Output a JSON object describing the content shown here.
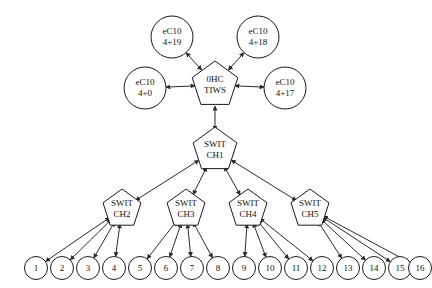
{
  "diagram": {
    "background_color": "#ffffff",
    "stroke_color": "#1a1a1a",
    "edge_color": "#2b2b2b",
    "text_color": "#111111",
    "edge_style": "bidirectional-arrow"
  },
  "root_switch": {
    "name": "switch-0",
    "shape": "pentagon",
    "line1": "0HC",
    "line2": "TIWS",
    "x": 215,
    "y": 85
  },
  "endpoints": [
    {
      "name": "endpoint-4-19",
      "line1": "eC10",
      "line2": "4+19",
      "x": 172,
      "y": 37
    },
    {
      "name": "endpoint-4-18",
      "line1": "eC10",
      "line2": "4+18",
      "x": 258,
      "y": 37
    },
    {
      "name": "endpoint-4-0",
      "line1": "eC10",
      "line2": "4+0",
      "x": 145,
      "y": 88
    },
    {
      "name": "endpoint-4-17",
      "line1": "eC10",
      "line2": "4+17",
      "x": 285,
      "y": 88
    }
  ],
  "mid_switch": {
    "name": "switch-1",
    "shape": "pentagon",
    "line1": "SWIT",
    "line2": "CH1",
    "x": 215,
    "y": 150
  },
  "lower_switches": [
    {
      "name": "switch-2",
      "line1": "SWIT",
      "line2": "CH2",
      "x": 122,
      "y": 209
    },
    {
      "name": "switch-3",
      "line1": "SWIT",
      "line2": "CH3",
      "x": 186,
      "y": 209
    },
    {
      "name": "switch-4",
      "line1": "SWIT",
      "line2": "CH4",
      "x": 248,
      "y": 209
    },
    {
      "name": "switch-5",
      "line1": "SWIT",
      "line2": "CH5",
      "x": 310,
      "y": 209
    }
  ],
  "leaf_nodes": [
    {
      "label": "1",
      "x": 36,
      "y": 268
    },
    {
      "label": "2",
      "x": 62,
      "y": 268
    },
    {
      "label": "3",
      "x": 88,
      "y": 268
    },
    {
      "label": "4",
      "x": 114,
      "y": 268
    },
    {
      "label": "5",
      "x": 140,
      "y": 268
    },
    {
      "label": "6",
      "x": 166,
      "y": 268
    },
    {
      "label": "7",
      "x": 192,
      "y": 268
    },
    {
      "label": "8",
      "x": 218,
      "y": 268
    },
    {
      "label": "9",
      "x": 244,
      "y": 268
    },
    {
      "label": "10",
      "x": 270,
      "y": 268
    },
    {
      "label": "11",
      "x": 296,
      "y": 268
    },
    {
      "label": "12",
      "x": 322,
      "y": 268
    },
    {
      "label": "13",
      "x": 348,
      "y": 268
    },
    {
      "label": "14",
      "x": 374,
      "y": 268
    },
    {
      "label": "15",
      "x": 400,
      "y": 268
    },
    {
      "label": "16",
      "x": 420,
      "y": 268
    }
  ],
  "connections": {
    "root_to_endpoints": 4,
    "root_to_mid": 1,
    "mid_to_lower": 4,
    "leaves_per_switch": 4
  }
}
